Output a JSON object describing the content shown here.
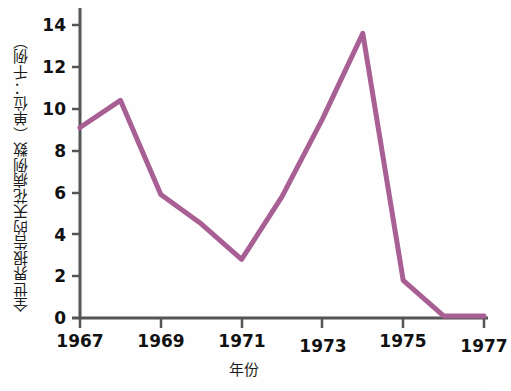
{
  "chart_data": {
    "type": "line",
    "title": "",
    "xlabel": "年份",
    "ylabel": "全世界报告的天花病例数（单位：千例）",
    "x": [
      1967,
      1968,
      1969,
      1970,
      1971,
      1972,
      1973,
      1974,
      1975,
      1976,
      1977
    ],
    "values": [
      9.1,
      10.4,
      5.9,
      4.5,
      2.8,
      5.8,
      9.5,
      13.6,
      1.8,
      0.1,
      0.1
    ],
    "series": [
      {
        "name": "全世界报告的天花病例数",
        "values": [
          9.1,
          10.4,
          5.9,
          4.5,
          2.8,
          5.8,
          9.5,
          13.6,
          1.8,
          0.1,
          0.1
        ],
        "color": "#a85f94"
      }
    ],
    "xlim": [
      1967,
      1977
    ],
    "ylim": [
      0,
      15
    ],
    "xticks": [
      1967,
      1969,
      1971,
      1973,
      1975,
      1977
    ],
    "xtick_labels": [
      "1967",
      "1969",
      "1971",
      "1973",
      "1975",
      "1977"
    ],
    "yticks": [
      0,
      2,
      4,
      6,
      8,
      10,
      12,
      14
    ],
    "ytick_labels": [
      "0",
      "2",
      "4",
      "6",
      "8",
      "10",
      "12",
      "14"
    ],
    "grid": false,
    "legend": "none",
    "axis_color": "#555555",
    "line_color": "#a85f94",
    "line_width": 5,
    "background": "#fefefe"
  }
}
